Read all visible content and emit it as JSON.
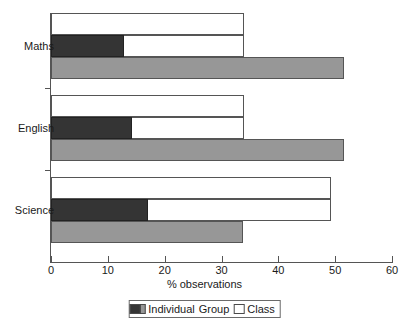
{
  "chart_data": {
    "type": "bar",
    "orientation": "horizontal",
    "title": "",
    "xlabel": "% observations",
    "ylabel": "",
    "xlim": [
      0,
      60
    ],
    "xticks": [
      0,
      10,
      20,
      30,
      40,
      50,
      60
    ],
    "xtick_labels": [
      "0",
      "10",
      "20",
      "30",
      "40",
      "50",
      "60"
    ],
    "grid": false,
    "legend_position": "bottom",
    "categories": [
      "Maths",
      "English",
      "Science"
    ],
    "series": [
      {
        "name": "Individual",
        "color": "#979797",
        "values": [
          51.6,
          51.6,
          33.8
        ]
      },
      {
        "name": "Group",
        "color": "#343434",
        "values": [
          12.9,
          14.3,
          17.1
        ]
      },
      {
        "name": "Class",
        "color": "#ffffff",
        "values": [
          34.0,
          34.0,
          49.3
        ]
      }
    ]
  },
  "legend": {
    "items": [
      {
        "label": "Individual",
        "swatch": "individual"
      },
      {
        "label": "Group",
        "swatch": "group"
      },
      {
        "label": "Class",
        "swatch": "cls"
      }
    ]
  }
}
